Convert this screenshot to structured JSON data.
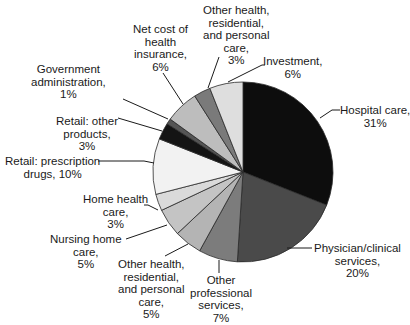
{
  "chart_data": {
    "type": "pie",
    "title": "",
    "unit": "%",
    "start_angle_deg": 0,
    "direction": "clockwise",
    "slices": [
      {
        "label": "Hospital care",
        "value": 31,
        "color": "#0d0d0d"
      },
      {
        "label": "Physician/clinical services",
        "value": 20,
        "color": "#4a4a4a"
      },
      {
        "label": "Other professional services",
        "value": 7,
        "color": "#7c7c7c"
      },
      {
        "label": "Other health, residential, and personal care",
        "value": 5,
        "color": "#b4b4b4"
      },
      {
        "label": "Nursing home care",
        "value": 5,
        "color": "#c4c4c4"
      },
      {
        "label": "Home health care",
        "value": 3,
        "color": "#dadada"
      },
      {
        "label": "Retail: prescription drugs",
        "value": 10,
        "color": "#f2f2f2"
      },
      {
        "label": "Retail: other products",
        "value": 3,
        "color": "#141414"
      },
      {
        "label": "Government administration",
        "value": 1,
        "color": "#555555"
      },
      {
        "label": "Net cost of health insurance",
        "value": 6,
        "color": "#bdbdbd"
      },
      {
        "label": "Other health, residential, and personal care",
        "value": 3,
        "color": "#7a7a7a"
      },
      {
        "label": "Investment",
        "value": 6,
        "color": "#dedede"
      }
    ]
  },
  "labels": [
    {
      "lines": [
        "Hospital care,",
        "31%"
      ]
    },
    {
      "lines": [
        "Physician/clinical",
        "services,",
        "20%"
      ]
    },
    {
      "lines": [
        "Other",
        "professional",
        "services,",
        "7%"
      ]
    },
    {
      "lines": [
        "Other health,",
        "residential,",
        "and personal",
        "care,",
        "5%"
      ]
    },
    {
      "lines": [
        "Nursing home",
        "care,",
        "5%"
      ]
    },
    {
      "lines": [
        "Home health",
        "care,",
        "3%"
      ]
    },
    {
      "lines": [
        "Retail: prescription",
        "drugs, 10%"
      ]
    },
    {
      "lines": [
        "Retail: other",
        "products,",
        "3%"
      ]
    },
    {
      "lines": [
        "Government",
        "administration,",
        "1%"
      ]
    },
    {
      "lines": [
        "Net cost of",
        "health",
        "insurance,",
        "6%"
      ]
    },
    {
      "lines": [
        "Other health,",
        "residential,",
        "and personal",
        "care,",
        "3%"
      ]
    },
    {
      "lines": [
        "Investment,",
        "6%"
      ]
    }
  ]
}
